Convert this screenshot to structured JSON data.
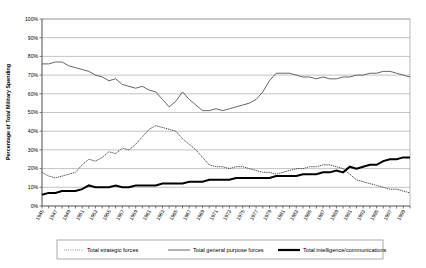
{
  "chart_data": {
    "type": "line",
    "title": "",
    "xlabel": "",
    "ylabel": "Percentage of Total Military Spending",
    "ylim": [
      0,
      100
    ],
    "ytick_labels": [
      "0%",
      "10%",
      "20%",
      "30%",
      "40%",
      "50%",
      "60%",
      "70%",
      "80%",
      "90%",
      "100%"
    ],
    "ytick_values": [
      0,
      10,
      20,
      30,
      40,
      50,
      60,
      70,
      80,
      90,
      100
    ],
    "grid": true,
    "legend_position": "bottom",
    "x": [
      1945,
      1946,
      1947,
      1948,
      1949,
      1950,
      1951,
      1952,
      1953,
      1954,
      1955,
      1956,
      1957,
      1958,
      1959,
      1960,
      1961,
      1962,
      1963,
      1964,
      1965,
      1966,
      1967,
      1968,
      1969,
      1970,
      1971,
      1972,
      1973,
      1974,
      1975,
      1976,
      1977,
      1978,
      1979,
      1980,
      1981,
      1982,
      1983,
      1984,
      1985,
      1986,
      1987,
      1988,
      1989,
      1990,
      1991,
      1992,
      1993,
      1994,
      1995,
      1996,
      1997,
      1998,
      1999,
      2000
    ],
    "xtick_labels": [
      "1945",
      "1947",
      "1949",
      "1951",
      "1953",
      "1955",
      "1957",
      "1959",
      "1961",
      "1963",
      "1965",
      "1967",
      "1969",
      "1971",
      "1973",
      "1975",
      "1977",
      "1979",
      "1981",
      "1983",
      "1985",
      "1987",
      "1989",
      "1991",
      "1993",
      "1995",
      "1997",
      "1999"
    ],
    "series": [
      {
        "name": "Total strategic forces",
        "style": "dotted",
        "values": [
          18,
          16,
          15,
          16,
          17,
          18,
          22,
          25,
          24,
          26,
          29,
          28,
          31,
          30,
          33,
          37,
          41,
          43,
          42,
          41,
          40,
          36,
          33,
          30,
          26,
          22,
          21,
          21,
          20,
          21,
          21,
          20,
          19,
          18,
          18,
          17,
          18,
          19,
          20,
          20,
          21,
          21,
          22,
          22,
          21,
          20,
          17,
          14,
          13,
          12,
          11,
          10,
          9,
          9,
          8,
          7
        ]
      },
      {
        "name": "Total general purpose forces",
        "style": "thin-solid",
        "values": [
          76,
          76,
          77,
          77,
          75,
          74,
          73,
          72,
          70,
          69,
          67,
          68,
          65,
          64,
          63,
          64,
          62,
          61,
          57,
          53,
          56,
          61,
          57,
          54,
          51,
          51,
          52,
          51,
          52,
          53,
          54,
          55,
          57,
          61,
          67,
          71,
          71,
          71,
          70,
          69,
          69,
          68,
          69,
          68,
          68,
          69,
          69,
          70,
          70,
          71,
          71,
          72,
          72,
          71,
          70,
          69
        ]
      },
      {
        "name": "Total intelligence/communications",
        "style": "thick-solid",
        "values": [
          6,
          7,
          7,
          8,
          8,
          8,
          9,
          11,
          10,
          10,
          10,
          11,
          10,
          10,
          11,
          11,
          11,
          11,
          12,
          12,
          12,
          12,
          13,
          13,
          13,
          14,
          14,
          14,
          14,
          15,
          15,
          15,
          15,
          15,
          15,
          16,
          16,
          16,
          16,
          17,
          17,
          17,
          18,
          18,
          19,
          18,
          21,
          20,
          21,
          22,
          22,
          24,
          25,
          25,
          26,
          26
        ]
      }
    ]
  },
  "legend": {
    "items": [
      {
        "label": "Total strategic forces"
      },
      {
        "label": "Total general purpose forces"
      },
      {
        "label": "Total intelligence/communications"
      }
    ]
  }
}
